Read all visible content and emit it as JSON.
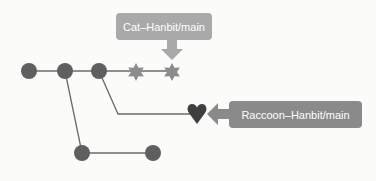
{
  "diagram": {
    "type": "git-branch-graph",
    "labels": {
      "cat": "Cat–Hanbit/main",
      "raccoon": "Raccoon–Hanbit/main"
    },
    "colors": {
      "node": "#5f5f5f",
      "edge": "#6a6a6a",
      "cat_label_bg": "#a9a9a9",
      "raccoon_label_bg": "#8a8a8a",
      "background": "#fbfbfa"
    },
    "nodes": [
      {
        "id": "c1",
        "shape": "circle"
      },
      {
        "id": "c2",
        "shape": "circle"
      },
      {
        "id": "c3",
        "shape": "circle"
      },
      {
        "id": "s1",
        "shape": "star"
      },
      {
        "id": "s2",
        "shape": "star"
      },
      {
        "id": "h1",
        "shape": "heart"
      },
      {
        "id": "b1",
        "shape": "circle"
      },
      {
        "id": "b2",
        "shape": "circle"
      }
    ]
  }
}
